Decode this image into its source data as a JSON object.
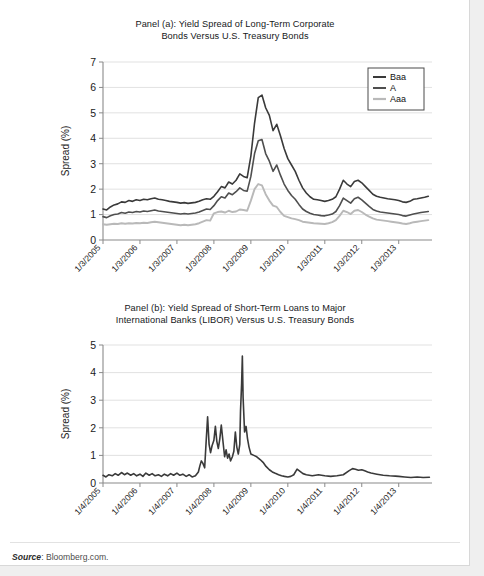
{
  "figure": {
    "source_label": "Source",
    "source_text": ": Bloomberg.com."
  },
  "panel_a": {
    "title_line1": "Panel (a): Yield Spread of Long-Term Corporate",
    "title_line2": "Bonds Versus U.S. Treasury Bonds",
    "title_bold": "Panel (a)"
  },
  "panel_b": {
    "title_line1": "Panel (b): Yield Spread of Short-Term Loans to Major",
    "title_line2": "International Banks (LIBOR) Versus U.S. Treasury Bonds",
    "title_bold": "Panel (b)"
  },
  "colors": {
    "baa": "#3a3a3a",
    "a": "#4f4f4f",
    "aaa": "#b9b9b9",
    "libor": "#3a3a3a",
    "grid": "#d9d9d9",
    "axis": "#8a8a8a"
  },
  "chart_data": [
    {
      "type": "line",
      "panel": "a",
      "title": "Panel (a): Yield Spread of Long-Term Corporate Bonds Versus U.S. Treasury Bonds",
      "xlabel": "",
      "ylabel": "Spread (%)",
      "ylim": [
        0,
        7
      ],
      "yticks": [
        0,
        1,
        2,
        3,
        4,
        5,
        6,
        7
      ],
      "grid": true,
      "legend_position": "top-right",
      "xtick_labels": [
        "1/3/2005",
        "1/3/2006",
        "1/3/2007",
        "1/3/2008",
        "1/3/2009",
        "1/3/2010",
        "1/3/2011",
        "1/3/2012",
        "1/3/2013"
      ],
      "xlim": [
        2005.0,
        2013.9
      ],
      "x": [
        2005.0,
        2005.1,
        2005.2,
        2005.3,
        2005.4,
        2005.5,
        2005.6,
        2005.7,
        2005.8,
        2005.9,
        2006.0,
        2006.1,
        2006.2,
        2006.3,
        2006.4,
        2006.5,
        2006.6,
        2006.7,
        2006.8,
        2006.9,
        2007.0,
        2007.1,
        2007.2,
        2007.3,
        2007.4,
        2007.5,
        2007.6,
        2007.7,
        2007.8,
        2007.9,
        2008.0,
        2008.1,
        2008.2,
        2008.3,
        2008.4,
        2008.5,
        2008.6,
        2008.7,
        2008.8,
        2008.9,
        2009.0,
        2009.1,
        2009.2,
        2009.3,
        2009.4,
        2009.5,
        2009.6,
        2009.7,
        2009.8,
        2009.9,
        2010.0,
        2010.1,
        2010.2,
        2010.3,
        2010.4,
        2010.5,
        2010.6,
        2010.7,
        2010.8,
        2010.9,
        2011.0,
        2011.1,
        2011.2,
        2011.3,
        2011.4,
        2011.5,
        2011.6,
        2011.7,
        2011.8,
        2011.9,
        2012.0,
        2012.1,
        2012.2,
        2012.3,
        2012.4,
        2012.5,
        2012.6,
        2012.7,
        2012.8,
        2012.9,
        2013.0,
        2013.1,
        2013.2,
        2013.3,
        2013.4,
        2013.5,
        2013.6,
        2013.7,
        2013.8
      ],
      "series": [
        {
          "name": "Baa",
          "color": "#3a3a3a",
          "values": [
            1.22,
            1.18,
            1.3,
            1.38,
            1.42,
            1.5,
            1.48,
            1.55,
            1.52,
            1.58,
            1.55,
            1.6,
            1.58,
            1.62,
            1.65,
            1.6,
            1.58,
            1.55,
            1.52,
            1.5,
            1.48,
            1.45,
            1.47,
            1.44,
            1.46,
            1.48,
            1.52,
            1.58,
            1.62,
            1.6,
            1.72,
            1.9,
            2.1,
            2.05,
            2.28,
            2.2,
            2.35,
            2.6,
            2.5,
            2.45,
            3.3,
            4.6,
            5.6,
            5.7,
            5.2,
            4.9,
            4.3,
            4.55,
            4.1,
            3.6,
            3.2,
            2.95,
            2.7,
            2.35,
            2.05,
            1.85,
            1.7,
            1.6,
            1.58,
            1.55,
            1.52,
            1.55,
            1.6,
            1.7,
            2.0,
            2.35,
            2.2,
            2.1,
            2.3,
            2.35,
            2.25,
            2.1,
            1.95,
            1.8,
            1.72,
            1.68,
            1.65,
            1.62,
            1.6,
            1.58,
            1.55,
            1.5,
            1.48,
            1.52,
            1.6,
            1.62,
            1.65,
            1.68,
            1.72
          ]
        },
        {
          "name": "A",
          "color": "#4f4f4f",
          "values": [
            0.92,
            0.88,
            0.95,
            1.0,
            1.02,
            1.08,
            1.05,
            1.1,
            1.08,
            1.12,
            1.1,
            1.14,
            1.12,
            1.15,
            1.18,
            1.14,
            1.12,
            1.1,
            1.08,
            1.06,
            1.04,
            1.02,
            1.04,
            1.02,
            1.04,
            1.06,
            1.1,
            1.16,
            1.22,
            1.2,
            1.35,
            1.55,
            1.7,
            1.65,
            1.85,
            1.78,
            1.9,
            2.05,
            1.95,
            1.92,
            2.5,
            3.4,
            3.9,
            3.95,
            3.4,
            3.1,
            2.7,
            2.95,
            2.55,
            2.2,
            1.95,
            1.75,
            1.6,
            1.4,
            1.22,
            1.12,
            1.05,
            1.0,
            0.98,
            0.96,
            0.95,
            0.98,
            1.02,
            1.12,
            1.35,
            1.65,
            1.55,
            1.45,
            1.62,
            1.68,
            1.58,
            1.45,
            1.32,
            1.2,
            1.14,
            1.1,
            1.08,
            1.06,
            1.04,
            1.02,
            1.0,
            0.96,
            0.94,
            0.98,
            1.02,
            1.05,
            1.08,
            1.1,
            1.12
          ]
        },
        {
          "name": "Aaa",
          "color": "#b9b9b9",
          "values": [
            0.62,
            0.6,
            0.62,
            0.64,
            0.63,
            0.66,
            0.64,
            0.66,
            0.65,
            0.67,
            0.66,
            0.68,
            0.67,
            0.7,
            0.72,
            0.7,
            0.68,
            0.66,
            0.64,
            0.62,
            0.6,
            0.58,
            0.6,
            0.58,
            0.6,
            0.62,
            0.66,
            0.72,
            0.78,
            0.76,
            1.05,
            1.1,
            1.12,
            1.08,
            1.15,
            1.1,
            1.12,
            1.2,
            1.18,
            1.15,
            1.55,
            2.0,
            2.2,
            2.15,
            1.8,
            1.55,
            1.35,
            1.3,
            1.1,
            0.95,
            0.9,
            0.85,
            0.82,
            0.78,
            0.72,
            0.7,
            0.68,
            0.66,
            0.65,
            0.64,
            0.63,
            0.66,
            0.7,
            0.78,
            0.95,
            1.15,
            1.1,
            1.02,
            1.15,
            1.18,
            1.1,
            1.0,
            0.92,
            0.85,
            0.8,
            0.78,
            0.76,
            0.74,
            0.72,
            0.7,
            0.68,
            0.65,
            0.63,
            0.66,
            0.7,
            0.72,
            0.74,
            0.76,
            0.78
          ]
        }
      ]
    },
    {
      "type": "line",
      "panel": "b",
      "title": "Panel (b): Yield Spread of Short-Term Loans to Major International Banks (LIBOR) Versus U.S. Treasury Bonds",
      "xlabel": "",
      "ylabel": "Spread (%)",
      "ylim": [
        0,
        5
      ],
      "yticks": [
        0,
        1,
        2,
        3,
        4,
        5
      ],
      "grid": true,
      "xtick_labels": [
        "1/4/2005",
        "1/4/2006",
        "1/4/2007",
        "1/4/2008",
        "1/4/2009",
        "1/4/2010",
        "1/4/2011",
        "1/4/2012",
        "1/4/2013"
      ],
      "xlim": [
        2005.0,
        2013.9
      ],
      "x": [
        2005.0,
        2005.08,
        2005.16,
        2005.25,
        2005.33,
        2005.41,
        2005.5,
        2005.58,
        2005.66,
        2005.75,
        2005.83,
        2005.91,
        2006.0,
        2006.08,
        2006.16,
        2006.25,
        2006.33,
        2006.41,
        2006.5,
        2006.58,
        2006.66,
        2006.75,
        2006.83,
        2006.91,
        2007.0,
        2007.08,
        2007.16,
        2007.25,
        2007.33,
        2007.41,
        2007.5,
        2007.58,
        2007.62,
        2007.66,
        2007.7,
        2007.75,
        2007.79,
        2007.83,
        2007.87,
        2007.91,
        2007.95,
        2008.0,
        2008.04,
        2008.08,
        2008.12,
        2008.16,
        2008.2,
        2008.25,
        2008.29,
        2008.33,
        2008.37,
        2008.41,
        2008.45,
        2008.5,
        2008.54,
        2008.58,
        2008.62,
        2008.66,
        2008.7,
        2008.72,
        2008.75,
        2008.77,
        2008.79,
        2008.83,
        2008.87,
        2008.91,
        2008.95,
        2009.0,
        2009.08,
        2009.16,
        2009.25,
        2009.33,
        2009.41,
        2009.5,
        2009.58,
        2009.66,
        2009.75,
        2009.83,
        2009.91,
        2010.0,
        2010.08,
        2010.16,
        2010.25,
        2010.33,
        2010.41,
        2010.5,
        2010.58,
        2010.66,
        2010.75,
        2010.83,
        2010.91,
        2011.0,
        2011.16,
        2011.33,
        2011.5,
        2011.66,
        2011.75,
        2011.83,
        2011.91,
        2012.0,
        2012.08,
        2012.16,
        2012.25,
        2012.41,
        2012.58,
        2012.75,
        2012.91,
        2013.0,
        2013.16,
        2013.33,
        2013.5,
        2013.66,
        2013.83
      ],
      "series": [
        {
          "name": "LIBOR spread",
          "color": "#3a3a3a",
          "values": [
            0.28,
            0.22,
            0.3,
            0.26,
            0.34,
            0.28,
            0.38,
            0.3,
            0.36,
            0.28,
            0.34,
            0.26,
            0.32,
            0.24,
            0.36,
            0.28,
            0.34,
            0.26,
            0.3,
            0.24,
            0.32,
            0.26,
            0.34,
            0.28,
            0.36,
            0.28,
            0.32,
            0.24,
            0.3,
            0.22,
            0.26,
            0.4,
            0.62,
            0.8,
            0.72,
            0.55,
            1.5,
            2.4,
            1.4,
            1.1,
            1.35,
            1.55,
            2.05,
            1.5,
            1.25,
            1.6,
            2.1,
            1.45,
            0.95,
            1.2,
            0.9,
            1.05,
            0.8,
            0.95,
            1.15,
            1.85,
            1.3,
            1.05,
            1.4,
            2.6,
            3.6,
            4.6,
            3.1,
            1.85,
            2.05,
            1.6,
            1.3,
            1.05,
            1.0,
            0.95,
            0.85,
            0.75,
            0.6,
            0.48,
            0.4,
            0.35,
            0.3,
            0.26,
            0.24,
            0.22,
            0.24,
            0.3,
            0.5,
            0.42,
            0.34,
            0.3,
            0.28,
            0.26,
            0.28,
            0.3,
            0.28,
            0.26,
            0.24,
            0.26,
            0.3,
            0.45,
            0.52,
            0.5,
            0.46,
            0.48,
            0.44,
            0.4,
            0.36,
            0.32,
            0.28,
            0.26,
            0.25,
            0.24,
            0.22,
            0.2,
            0.22,
            0.2,
            0.21
          ]
        }
      ]
    }
  ]
}
